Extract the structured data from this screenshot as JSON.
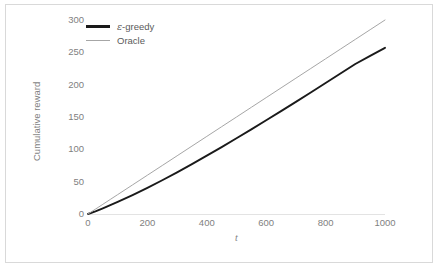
{
  "chart_data": {
    "type": "line",
    "title": "",
    "xlabel": "t",
    "ylabel": "Cumulative reward",
    "xlim": [
      0,
      1000
    ],
    "ylim": [
      0,
      300
    ],
    "xticks": [
      "0",
      "200",
      "400",
      "600",
      "800",
      "1000"
    ],
    "xtick_values": [
      0,
      200,
      400,
      600,
      800,
      1000
    ],
    "yticks": [
      "0",
      "50",
      "100",
      "150",
      "200",
      "250",
      "300"
    ],
    "ytick_values": [
      0,
      50,
      100,
      150,
      200,
      250,
      300
    ],
    "grid": false,
    "legend_position": "top-left",
    "x": [
      0,
      25,
      50,
      75,
      100,
      150,
      200,
      250,
      300,
      350,
      400,
      450,
      500,
      550,
      600,
      650,
      700,
      750,
      800,
      850,
      900,
      950,
      1000
    ],
    "series": [
      {
        "name": "ε-greedy",
        "color": "#1a1a1a",
        "width": 1.9,
        "values": [
          0,
          4.2,
          8.8,
          13.6,
          18.6,
          29.2,
          40.4,
          52.2,
          64.5,
          77.2,
          90.2,
          103.5,
          117.1,
          130.9,
          144.9,
          159.1,
          173.4,
          187.9,
          202.5,
          217.2,
          232.0,
          244.5,
          257.0
        ]
      },
      {
        "name": "Oracle",
        "color": "#a6a6a6",
        "width": 1.0,
        "values": [
          0,
          7.5,
          15,
          22.5,
          30,
          45,
          60,
          75,
          90,
          105,
          120,
          135,
          150,
          165,
          180,
          195,
          210,
          225,
          240,
          255,
          270,
          285,
          300
        ]
      }
    ]
  },
  "legend": {
    "items": [
      {
        "label_prefix": "ε",
        "label_suffix": "-greedy",
        "color": "#1a1a1a",
        "width": 2.6
      },
      {
        "label_prefix": "",
        "label_suffix": "Oracle",
        "color": "#a6a6a6",
        "width": 1.3
      }
    ]
  },
  "colors": {
    "epsilon_greedy": "#1a1a1a",
    "oracle": "#a6a6a6",
    "tick_text": "#7f7f7f",
    "frame": "#d9d9d9",
    "axis": "#e3e3e3",
    "background": "#ffffff"
  }
}
